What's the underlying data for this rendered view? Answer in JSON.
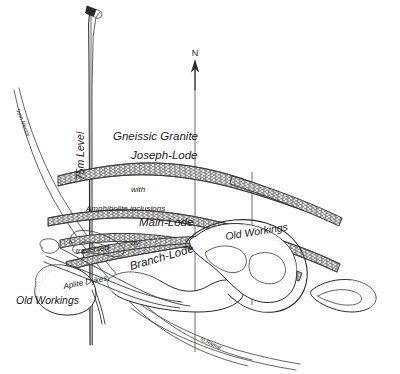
{
  "figure": {
    "kind": "geological-mine-plan",
    "background_color": "#ffffff",
    "ink_color": "#2a2a2a",
    "width": 400,
    "height": 374
  },
  "compass": {
    "north_label": "N",
    "direction": "up"
  },
  "labels": {
    "formation": "Gneissic Granite",
    "joseph_lode": "Joseph-Lode",
    "with": "with",
    "amphibolite": "Amphibolite inclusions",
    "main_lode": "Main-Lode",
    "branch_lode": "Branch-Lode",
    "traversed": "traversed",
    "by": "by",
    "aplite_dykes": "Aplite Dykes",
    "old_workings_left": "Old Workings",
    "old_workings_right": "Old Workings",
    "level": "75m Level",
    "road_top": "from Mecca",
    "road_bottom": "to Ramal"
  },
  "features": [
    {
      "name": "joseph-lode",
      "type": "lode",
      "label": "Joseph-Lode",
      "hatched": true
    },
    {
      "name": "main-lode",
      "type": "lode",
      "label": "Main-Lode",
      "hatched": true
    },
    {
      "name": "branch-lode",
      "type": "lode",
      "label": "Branch-Lode",
      "hatched": true
    },
    {
      "name": "aplite-dykes",
      "type": "dyke",
      "label": "Aplite Dykes",
      "hatched": false
    },
    {
      "name": "old-workings-left",
      "type": "workings",
      "label": "Old Workings",
      "hatched": false
    },
    {
      "name": "old-workings-right",
      "type": "workings",
      "label": "Old Workings",
      "hatched": false
    },
    {
      "name": "gneissic-granite",
      "type": "country-rock",
      "label": "Gneissic Granite",
      "hatched": false
    }
  ]
}
